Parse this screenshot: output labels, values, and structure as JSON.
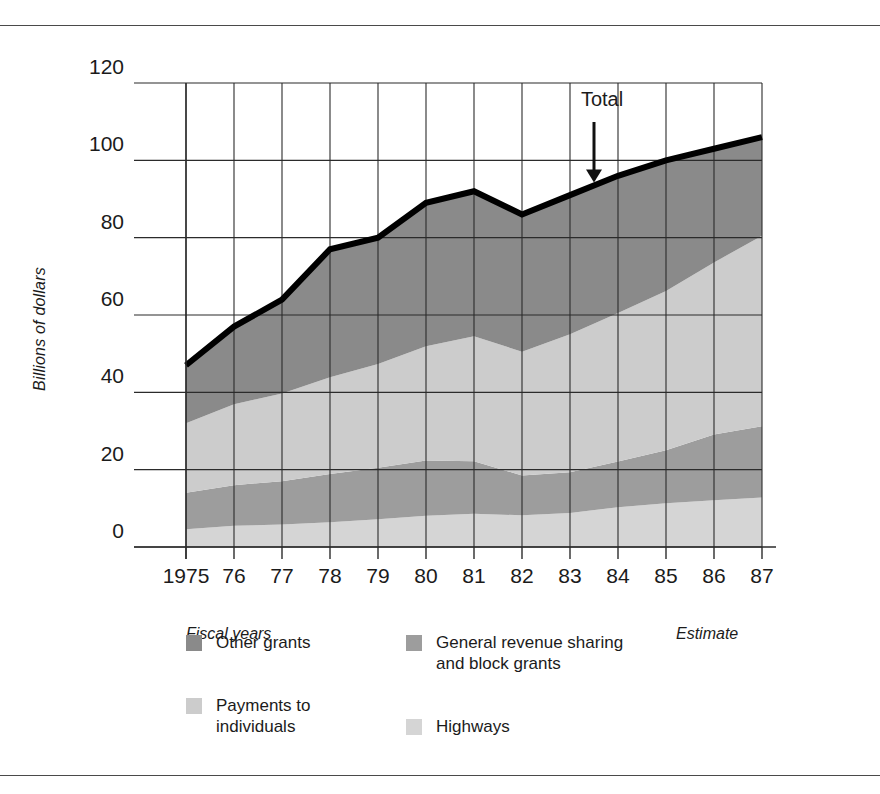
{
  "chart_data": {
    "type": "area",
    "title": "",
    "subtitle": "",
    "xlabel": "Fiscal years",
    "ylabel": "Billions of dollars",
    "estimate_note": "Estimate",
    "total_annotation": "Total",
    "grid": true,
    "legend_position": "bottom",
    "stacked": true,
    "xlim": [
      1975,
      1987
    ],
    "ylim": [
      0,
      120
    ],
    "yticks": [
      0,
      20,
      40,
      60,
      80,
      100,
      120
    ],
    "ytick_labels": [
      "0",
      "20",
      "40",
      "60",
      "80",
      "100",
      "120"
    ],
    "x": [
      1975,
      1976,
      1977,
      1978,
      1979,
      1980,
      1981,
      1982,
      1983,
      1984,
      1985,
      1986,
      1987
    ],
    "xtick_labels": [
      "1975",
      "76",
      "77",
      "78",
      "79",
      "80",
      "81",
      "82",
      "83",
      "84",
      "85",
      "86",
      "87"
    ],
    "series": [
      {
        "name": "Highways",
        "color": "#d5d5d5",
        "stack_order": 1,
        "values": [
          4.6,
          5.5,
          5.8,
          6.4,
          7.2,
          8.1,
          8.6,
          8.2,
          8.8,
          10.3,
          11.3,
          12.1,
          12.8
        ]
      },
      {
        "name": "General revenue sharing and block grants",
        "color": "#9d9d9d",
        "stack_order": 2,
        "values": [
          9.4,
          10.5,
          11.2,
          12.5,
          13.3,
          14.3,
          13.6,
          10.3,
          10.5,
          11.8,
          13.7,
          17.0,
          18.4
        ]
      },
      {
        "name": "Payments to individuals",
        "color": "#cccccc",
        "stack_order": 3,
        "values": [
          18.0,
          20.9,
          22.7,
          25.0,
          26.8,
          29.5,
          32.3,
          32.0,
          35.7,
          38.4,
          41.2,
          44.5,
          49.3
        ]
      },
      {
        "name": "Other grants",
        "color": "#8a8a8a",
        "stack_order": 4,
        "values": [
          15.0,
          20.1,
          24.3,
          33.1,
          32.7,
          37.1,
          37.5,
          35.5,
          36.0,
          35.5,
          33.8,
          29.4,
          25.5
        ]
      }
    ],
    "total": {
      "name": "Total",
      "color": "#000000",
      "values": [
        47,
        57,
        64,
        77,
        80,
        89,
        92,
        86,
        91,
        96,
        100,
        103,
        106
      ]
    }
  },
  "legend": {
    "items": [
      {
        "label": "Other grants",
        "color": "#8a8a8a",
        "swatch_name": "legend-swatch-other-grants"
      },
      {
        "label": "General revenue sharing\nand block grants",
        "color": "#9d9d9d",
        "swatch_name": "legend-swatch-general-revenue-sharing"
      },
      {
        "label": "Payments to\nindividuals",
        "color": "#cccccc",
        "swatch_name": "legend-swatch-payments-to-individuals"
      },
      {
        "label": "Highways",
        "color": "#d5d5d5",
        "swatch_name": "legend-swatch-highways"
      }
    ]
  },
  "axis": {
    "y_title": "Billions of dollars",
    "x_note_left": "Fiscal years",
    "x_note_right": "Estimate"
  },
  "annotations": {
    "total_label": "Total"
  },
  "colors": {
    "axis": "#2b2b2b",
    "grid": "#2b2b2b",
    "total_line": "#000000",
    "text": "#1b1b1b",
    "rule": "#4a4a4a"
  }
}
